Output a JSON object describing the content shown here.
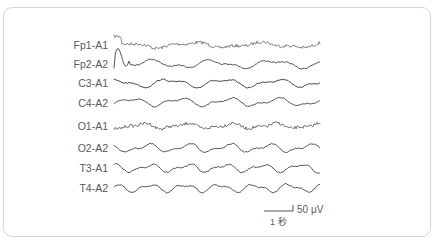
{
  "chart_data": {
    "type": "line",
    "title": "",
    "xlabel": "",
    "ylabel": "",
    "grid": false,
    "legend": "none",
    "channels": [
      {
        "name": "Fp1-A1",
        "y": 45,
        "color": "#6a6a6a",
        "noisy": true
      },
      {
        "name": "Fp2-A2",
        "y": 64,
        "color": "#555555",
        "noisy": false
      },
      {
        "name": "C3-A1",
        "y": 83,
        "color": "#444444",
        "noisy": false
      },
      {
        "name": "C4-A2",
        "y": 102,
        "color": "#555555",
        "noisy": false
      },
      {
        "name": "O1-A1",
        "y": 126,
        "color": "#555555",
        "noisy": true
      },
      {
        "name": "O2-A2",
        "y": 148,
        "color": "#555555",
        "noisy": false
      },
      {
        "name": "T3-A1",
        "y": 168,
        "color": "#555555",
        "noisy": false
      },
      {
        "name": "T4-A2",
        "y": 188,
        "color": "#555555",
        "noisy": false
      }
    ],
    "scale_bar": {
      "amplitude_label": "50 μV",
      "time_label": "1 秒"
    }
  },
  "labels": {
    "ch0": "Fp1-A1",
    "ch1": "Fp2-A2",
    "ch2": "C3-A1",
    "ch3": "C4-A2",
    "ch4": "O1-A1",
    "ch5": "O2-A2",
    "ch6": "T3-A1",
    "ch7": "T4-A2"
  },
  "scale": {
    "amplitude": "50 μV",
    "time": "1 秒"
  }
}
